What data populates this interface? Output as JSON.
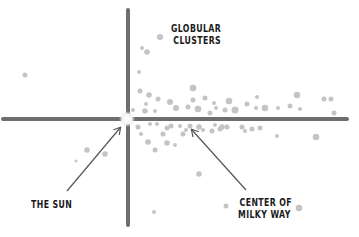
{
  "diagram": {
    "title_label": {
      "line1": "GLOBULAR",
      "line2": "CLUSTERS"
    },
    "sun_label": "THE SUN",
    "center_label": {
      "line1": "CENTER OF",
      "line2": "MILKY WAY"
    },
    "colors": {
      "axis": "#6e6e6e",
      "dot": "#c4c4c4",
      "sun_glow": "#f2f2f2",
      "arrow": "#555555",
      "text": "#1a1a1a"
    },
    "axes": {
      "horizontal": {
        "x1": 3,
        "y1": 119,
        "x2": 347,
        "y2": 119
      },
      "vertical": {
        "x1": 128,
        "y1": 10,
        "x2": 128,
        "y2": 225
      }
    },
    "sun": {
      "x": 127,
      "y": 119,
      "r": 8
    },
    "arrows": [
      {
        "from_x": 67,
        "from_y": 191,
        "to_x": 120,
        "to_y": 128
      },
      {
        "from_x": 246,
        "from_y": 190,
        "to_x": 192,
        "to_y": 130
      }
    ],
    "clusters": [
      {
        "x": 25,
        "y": 75,
        "r": 2.5
      },
      {
        "x": 160,
        "y": 37,
        "r": 3
      },
      {
        "x": 142,
        "y": 48,
        "r": 2
      },
      {
        "x": 147,
        "y": 52,
        "r": 2.8
      },
      {
        "x": 139,
        "y": 72,
        "r": 2
      },
      {
        "x": 140,
        "y": 91,
        "r": 2.5
      },
      {
        "x": 149,
        "y": 95,
        "r": 2.8
      },
      {
        "x": 146,
        "y": 104,
        "r": 2
      },
      {
        "x": 158,
        "y": 99,
        "r": 2.5
      },
      {
        "x": 170,
        "y": 102,
        "r": 3
      },
      {
        "x": 176,
        "y": 108,
        "r": 3
      },
      {
        "x": 145,
        "y": 111,
        "r": 2.8
      },
      {
        "x": 155,
        "y": 111,
        "r": 2
      },
      {
        "x": 133,
        "y": 110,
        "r": 2
      },
      {
        "x": 193,
        "y": 88,
        "r": 3.3
      },
      {
        "x": 205,
        "y": 98,
        "r": 2.5
      },
      {
        "x": 193,
        "y": 100,
        "r": 2.5
      },
      {
        "x": 198,
        "y": 109,
        "r": 3.3
      },
      {
        "x": 188,
        "y": 107,
        "r": 2.5
      },
      {
        "x": 214,
        "y": 103,
        "r": 2
      },
      {
        "x": 216,
        "y": 108,
        "r": 2
      },
      {
        "x": 229,
        "y": 101,
        "r": 3.3
      },
      {
        "x": 210,
        "y": 113,
        "r": 2.5
      },
      {
        "x": 225,
        "y": 110,
        "r": 2.5
      },
      {
        "x": 235,
        "y": 110,
        "r": 3.5
      },
      {
        "x": 247,
        "y": 104,
        "r": 2.5
      },
      {
        "x": 257,
        "y": 97,
        "r": 2
      },
      {
        "x": 256,
        "y": 108,
        "r": 2
      },
      {
        "x": 265,
        "y": 108,
        "r": 3.3
      },
      {
        "x": 278,
        "y": 108,
        "r": 2
      },
      {
        "x": 290,
        "y": 106,
        "r": 2.5
      },
      {
        "x": 300,
        "y": 109,
        "r": 2
      },
      {
        "x": 297,
        "y": 95,
        "r": 3.3
      },
      {
        "x": 324,
        "y": 99,
        "r": 2.5
      },
      {
        "x": 331,
        "y": 99,
        "r": 2.5
      },
      {
        "x": 334,
        "y": 113,
        "r": 2.5
      },
      {
        "x": 87,
        "y": 150,
        "r": 2.8
      },
      {
        "x": 105,
        "y": 154,
        "r": 2.8
      },
      {
        "x": 76,
        "y": 161,
        "r": 1.5
      },
      {
        "x": 138,
        "y": 127,
        "r": 2.5
      },
      {
        "x": 141,
        "y": 134,
        "r": 2
      },
      {
        "x": 150,
        "y": 124,
        "r": 2
      },
      {
        "x": 148,
        "y": 142,
        "r": 2.8
      },
      {
        "x": 155,
        "y": 150,
        "r": 2.5
      },
      {
        "x": 157,
        "y": 124,
        "r": 2
      },
      {
        "x": 163,
        "y": 134,
        "r": 2.5
      },
      {
        "x": 167,
        "y": 128,
        "r": 2.5
      },
      {
        "x": 167,
        "y": 143,
        "r": 2.8
      },
      {
        "x": 171,
        "y": 126,
        "r": 2.5
      },
      {
        "x": 175,
        "y": 145,
        "r": 2
      },
      {
        "x": 183,
        "y": 134,
        "r": 2.5
      },
      {
        "x": 180,
        "y": 126,
        "r": 2
      },
      {
        "x": 190,
        "y": 126,
        "r": 2.5
      },
      {
        "x": 186,
        "y": 130,
        "r": 2
      },
      {
        "x": 199,
        "y": 127,
        "r": 2.8
      },
      {
        "x": 203,
        "y": 130,
        "r": 2
      },
      {
        "x": 212,
        "y": 131,
        "r": 2.5
      },
      {
        "x": 220,
        "y": 129,
        "r": 2.5
      },
      {
        "x": 215,
        "y": 125,
        "r": 2
      },
      {
        "x": 222,
        "y": 127,
        "r": 2.8
      },
      {
        "x": 227,
        "y": 127,
        "r": 2.5
      },
      {
        "x": 242,
        "y": 127,
        "r": 2.5
      },
      {
        "x": 245,
        "y": 131,
        "r": 2
      },
      {
        "x": 252,
        "y": 129,
        "r": 2.5
      },
      {
        "x": 260,
        "y": 128,
        "r": 2.5
      },
      {
        "x": 277,
        "y": 136,
        "r": 2
      },
      {
        "x": 316,
        "y": 137,
        "r": 3.3
      },
      {
        "x": 199,
        "y": 174,
        "r": 2.8
      },
      {
        "x": 154,
        "y": 212,
        "r": 2
      },
      {
        "x": 226,
        "y": 206,
        "r": 2.5
      },
      {
        "x": 299,
        "y": 208,
        "r": 3.3
      }
    ]
  }
}
